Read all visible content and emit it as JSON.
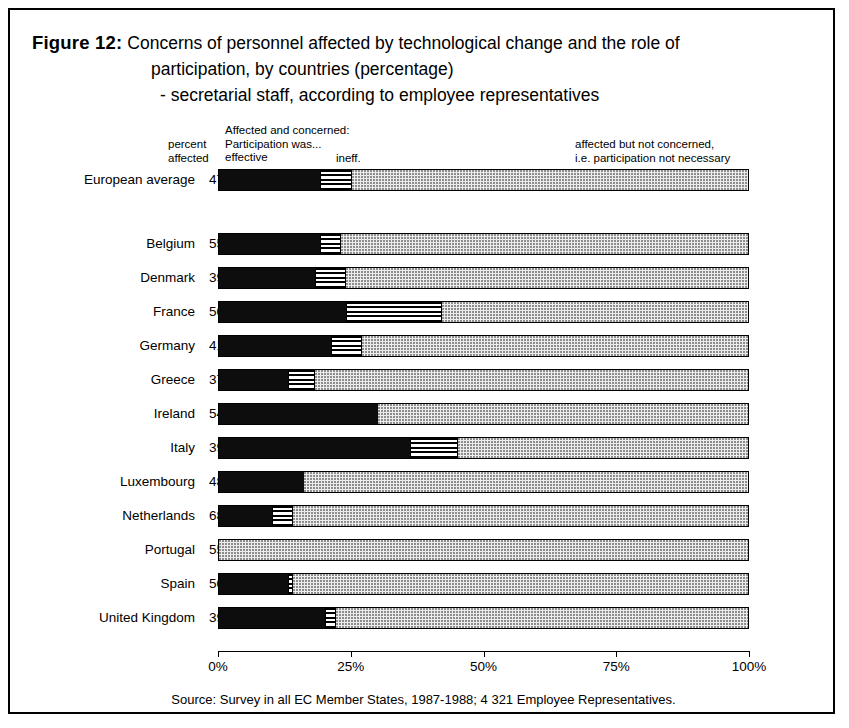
{
  "figure": {
    "label": "Figure 12:",
    "title_line1": "Concerns of personnel affected by technological change and the role of",
    "title_line2": "participation, by countries (percentage)",
    "title_line3": "- secretarial staff, according to employee representatives",
    "source": "Source: Survey in all EC Member States, 1987-1988; 4 321 Employee Representatives."
  },
  "legend": {
    "percent_affected": "percent\naffected",
    "percent_affected_line1": "percent",
    "percent_affected_line2": "affected",
    "concerned_heading_line1": "Affected and concerned:",
    "concerned_heading_line2": "Participation was...",
    "effective_label": "effective",
    "ineffective_label": "ineff.",
    "not_concerned_line1": "affected but not concerned,",
    "not_concerned_line2": "i.e. participation not necessary"
  },
  "colors": {
    "effective": "#0d0d0d",
    "ineffective": "#ffffff",
    "not_concerned": "#ececec",
    "border": "#000000",
    "background": "#ffffff"
  },
  "chart_data": {
    "type": "bar",
    "orientation": "horizontal",
    "stacked": true,
    "title": "Concerns of personnel affected by technological change and the role of participation, by countries (percentage) - secretarial staff, according to employee representatives",
    "xlabel": "",
    "ylabel": "",
    "xlim": [
      0,
      100
    ],
    "xticks": [
      0,
      25,
      50,
      75,
      100
    ],
    "xticklabels": [
      "0%",
      "25%",
      "50%",
      "75%",
      "100%"
    ],
    "grid": false,
    "legend_position": "top",
    "series": [
      {
        "name": "Affected and concerned: participation was effective",
        "key": "effective"
      },
      {
        "name": "Affected and concerned: participation was ineffective",
        "key": "ineffective"
      },
      {
        "name": "Affected but not concerned, i.e. participation not necessary",
        "key": "not_concerned"
      }
    ],
    "categories": [
      "European average",
      "Belgium",
      "Denmark",
      "France",
      "Germany",
      "Greece",
      "Ireland",
      "Italy",
      "Luxembourg",
      "Netherlands",
      "Portugal",
      "Spain",
      "United Kingdom"
    ],
    "rows": [
      {
        "country": "European average",
        "percent_affected": "47",
        "effective": 19,
        "ineffective": 6,
        "not_concerned": 75,
        "separated": true
      },
      {
        "country": "Belgium",
        "percent_affected": "55",
        "effective": 19,
        "ineffective": 4,
        "not_concerned": 77,
        "separated": false
      },
      {
        "country": "Denmark",
        "percent_affected": "39",
        "effective": 18,
        "ineffective": 6,
        "not_concerned": 76,
        "separated": false
      },
      {
        "country": "France",
        "percent_affected": "50",
        "effective": 24,
        "ineffective": 18,
        "not_concerned": 58,
        "separated": false
      },
      {
        "country": "Germany",
        "percent_affected": "41",
        "effective": 21,
        "ineffective": 6,
        "not_concerned": 73,
        "separated": false
      },
      {
        "country": "Greece",
        "percent_affected": "37",
        "effective": 13,
        "ineffective": 5,
        "not_concerned": 82,
        "separated": false
      },
      {
        "country": "Ireland",
        "percent_affected": "54",
        "effective": 30,
        "ineffective": 0,
        "not_concerned": 70,
        "separated": false
      },
      {
        "country": "Italy",
        "percent_affected": "39",
        "effective": 36,
        "ineffective": 9,
        "not_concerned": 55,
        "separated": false
      },
      {
        "country": "Luxembourg",
        "percent_affected": "48",
        "effective": 16,
        "ineffective": 0,
        "not_concerned": 84,
        "separated": false
      },
      {
        "country": "Netherlands",
        "percent_affected": "68",
        "effective": 10,
        "ineffective": 4,
        "not_concerned": 86,
        "separated": false
      },
      {
        "country": "Portugal",
        "percent_affected": "55",
        "effective": 0,
        "ineffective": 0,
        "not_concerned": 100,
        "separated": false
      },
      {
        "country": "Spain",
        "percent_affected": "50",
        "effective": 13,
        "ineffective": 1,
        "not_concerned": 86,
        "separated": false
      },
      {
        "country": "United Kingdom",
        "percent_affected": "39",
        "effective": 20,
        "ineffective": 2,
        "not_concerned": 78,
        "separated": false
      }
    ]
  }
}
